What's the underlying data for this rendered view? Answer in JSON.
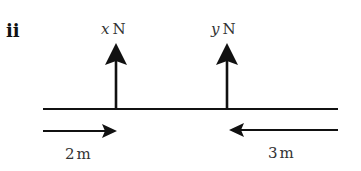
{
  "part_label": "ii",
  "forces": [
    {
      "var": "x",
      "unit": "N",
      "direction": "up",
      "x": 116
    },
    {
      "var": "y",
      "unit": "N",
      "direction": "up",
      "x": 227
    }
  ],
  "beam": {
    "x1": 43,
    "x2": 338,
    "y": 109
  },
  "distances": [
    {
      "value": "2",
      "unit": "m",
      "direction": "right",
      "from": 43,
      "to": 117
    },
    {
      "value": "3",
      "unit": "m",
      "direction": "left",
      "from": 338,
      "to": 229
    }
  ],
  "colors": {
    "line": "#111111",
    "text": "#333333"
  }
}
